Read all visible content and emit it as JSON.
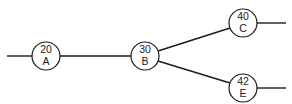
{
  "diagram": {
    "type": "network",
    "colors": {
      "line": "#1a1a1a",
      "node_fill": "#ffffff",
      "text": "#222222"
    },
    "nodes": [
      {
        "id": "A",
        "value": "20",
        "label": "A",
        "cx": 46,
        "cy": 56
      },
      {
        "id": "B",
        "value": "30",
        "label": "B",
        "cx": 145,
        "cy": 56
      },
      {
        "id": "C",
        "value": "40",
        "label": "C",
        "cx": 243,
        "cy": 23
      },
      {
        "id": "E",
        "value": "42",
        "label": "E",
        "cx": 243,
        "cy": 88
      }
    ],
    "edges": [
      {
        "from": "start",
        "to": "A"
      },
      {
        "from": "A",
        "to": "B"
      },
      {
        "from": "B",
        "to": "C"
      },
      {
        "from": "B",
        "to": "E"
      },
      {
        "from": "C",
        "to": "end"
      },
      {
        "from": "E",
        "to": "end"
      }
    ]
  }
}
